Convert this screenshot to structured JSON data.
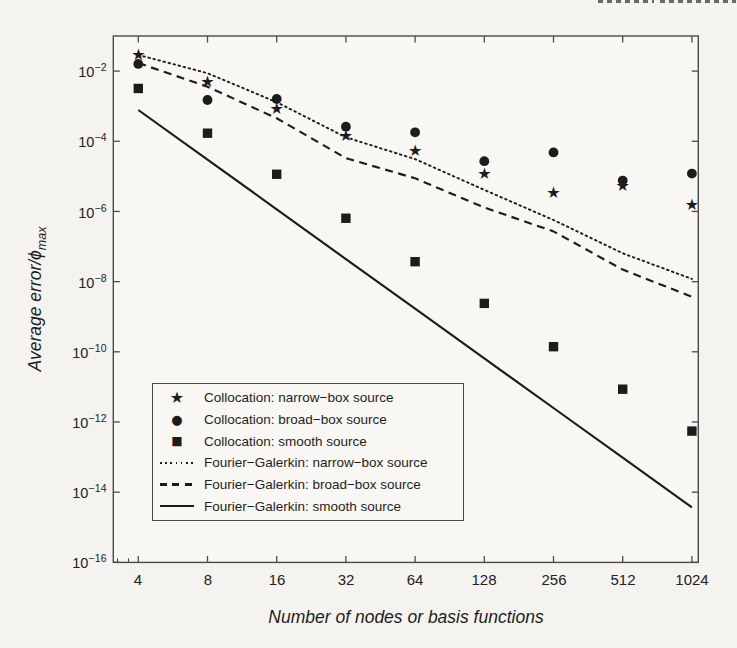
{
  "axes": {
    "x_ticks": [
      "4",
      "8",
      "16",
      "32",
      "64",
      "128",
      "256",
      "512",
      "1024"
    ],
    "y_ticks": [
      {
        "base": "10",
        "exp": "−2"
      },
      {
        "base": "10",
        "exp": "−4"
      },
      {
        "base": "10",
        "exp": "−6"
      },
      {
        "base": "10",
        "exp": "−8"
      },
      {
        "base": "10",
        "exp": "−10"
      },
      {
        "base": "10",
        "exp": "−12"
      },
      {
        "base": "10",
        "exp": "−14"
      },
      {
        "base": "10",
        "exp": "−16"
      }
    ],
    "xlabel": "Number of nodes or basis functions",
    "ylabel_text": "Average error/ϕ",
    "ylabel_sub": "max"
  },
  "legend": {
    "items": [
      {
        "glyph": "★",
        "sample": "star-marker",
        "label": "Collocation: narrow−box source"
      },
      {
        "glyph": "●",
        "sample": "circle-marker",
        "label": "Collocation: broad−box source"
      },
      {
        "glyph": "■",
        "sample": "square-marker",
        "label": "Collocation: smooth source"
      },
      {
        "glyph": "",
        "sample": "dotted-line",
        "label": "Fourier−Galerkin: narrow−box source"
      },
      {
        "glyph": "",
        "sample": "dashed-line",
        "label": "Fourier−Galerkin: broad−box source"
      },
      {
        "glyph": "",
        "sample": "solid-line",
        "label": "Fourier−Galerkin: smooth source"
      }
    ]
  },
  "colors": {
    "ink": "#1c1c1c",
    "axis": "#4a4a4a",
    "page_background": "#f4f3f0",
    "plot_background": "#f8f7f4"
  },
  "chart_data": {
    "type": "line",
    "x_scale": "log2",
    "y_scale": "log10",
    "x": [
      4,
      8,
      16,
      32,
      64,
      128,
      256,
      512,
      1024
    ],
    "xlim": [
      3.1,
      1100
    ],
    "ylim": [
      1e-16,
      0.1
    ],
    "grid": false,
    "legend_position": "inside lower-left",
    "title": "",
    "xlabel": "Number of nodes or basis functions",
    "ylabel": "Average error/phi_max",
    "series": [
      {
        "name": "Collocation: narrow-box source",
        "marker": "star",
        "line": "none",
        "values": [
          0.031,
          0.0053,
          0.00093,
          0.000155,
          6e-05,
          1.3e-05,
          3.6e-06,
          5.8e-06,
          1.7e-06
        ]
      },
      {
        "name": "Collocation: broad-box source",
        "marker": "circle",
        "line": "none",
        "values": [
          0.016,
          0.0015,
          0.0016,
          0.00026,
          0.00018,
          2.7e-05,
          4.8e-05,
          7.6e-06,
          1.2e-05
        ]
      },
      {
        "name": "Collocation: smooth source",
        "marker": "square",
        "line": "none",
        "values": [
          0.0032,
          0.00017,
          1.15e-05,
          6.4e-07,
          3.7e-08,
          2.4e-09,
          1.4e-10,
          8.6e-12,
          5.5e-13
        ]
      },
      {
        "name": "Fourier-Galerkin: narrow-box source",
        "marker": "none",
        "line": "dotted",
        "values": [
          0.029,
          0.0087,
          0.0013,
          0.00013,
          3.1e-05,
          4.1e-06,
          5.7e-07,
          6.4e-08,
          1.2e-08
        ]
      },
      {
        "name": "Fourier-Galerkin: broad-box source",
        "marker": "none",
        "line": "dashed",
        "values": [
          0.017,
          0.0036,
          0.00045,
          3.3e-05,
          8.8e-06,
          1.3e-06,
          2.7e-07,
          2.2e-08,
          3.7e-09
        ]
      },
      {
        "name": "Fourier-Galerkin: smooth source",
        "marker": "none",
        "line": "solid",
        "values": [
          0.00078,
          3e-05,
          1.15e-06,
          4.4e-08,
          1.7e-09,
          6.5e-11,
          2.5e-12,
          9.6e-14,
          3.7e-15
        ]
      }
    ]
  }
}
